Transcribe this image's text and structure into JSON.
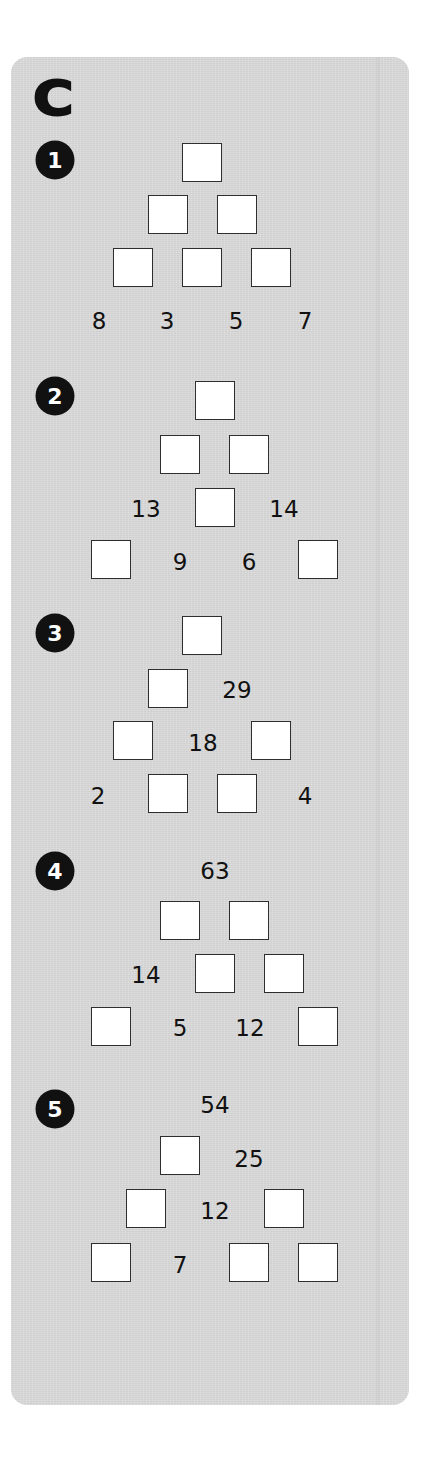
{
  "section": {
    "letter": "C",
    "background_color": "#d8d8d8",
    "box_fill": "#ffffff",
    "box_border": "#2e2e2e",
    "badge_color": "#111111"
  },
  "puzzles": [
    {
      "number": "1",
      "badge": {
        "cx": 55,
        "cy": 160
      },
      "boxes": [
        {
          "x": 182,
          "y": 143
        },
        {
          "x": 148,
          "y": 195
        },
        {
          "x": 217,
          "y": 195
        },
        {
          "x": 113,
          "y": 248
        },
        {
          "x": 182,
          "y": 248
        },
        {
          "x": 251,
          "y": 248
        }
      ],
      "numbers": [
        {
          "value": "8",
          "cx": 99,
          "cy": 321
        },
        {
          "value": "3",
          "cx": 167,
          "cy": 321
        },
        {
          "value": "5",
          "cx": 236,
          "cy": 321
        },
        {
          "value": "7",
          "cx": 305,
          "cy": 321
        }
      ]
    },
    {
      "number": "2",
      "badge": {
        "cx": 55,
        "cy": 396
      },
      "boxes": [
        {
          "x": 195,
          "y": 381
        },
        {
          "x": 160,
          "y": 435
        },
        {
          "x": 229,
          "y": 435
        },
        {
          "x": 195,
          "y": 488
        },
        {
          "x": 91,
          "y": 540
        },
        {
          "x": 298,
          "y": 540
        }
      ],
      "numbers": [
        {
          "value": "13",
          "cx": 146,
          "cy": 509
        },
        {
          "value": "14",
          "cx": 284,
          "cy": 509
        },
        {
          "value": "9",
          "cx": 180,
          "cy": 562
        },
        {
          "value": "6",
          "cx": 249,
          "cy": 562
        }
      ]
    },
    {
      "number": "3",
      "badge": {
        "cx": 55,
        "cy": 633
      },
      "boxes": [
        {
          "x": 182,
          "y": 616
        },
        {
          "x": 148,
          "y": 669
        },
        {
          "x": 113,
          "y": 721
        },
        {
          "x": 251,
          "y": 721
        },
        {
          "x": 148,
          "y": 774
        },
        {
          "x": 217,
          "y": 774
        }
      ],
      "numbers": [
        {
          "value": "29",
          "cx": 237,
          "cy": 690
        },
        {
          "value": "18",
          "cx": 203,
          "cy": 743
        },
        {
          "value": "2",
          "cx": 98,
          "cy": 796
        },
        {
          "value": "4",
          "cx": 305,
          "cy": 796
        }
      ]
    },
    {
      "number": "4",
      "badge": {
        "cx": 55,
        "cy": 871
      },
      "boxes": [
        {
          "x": 160,
          "y": 901
        },
        {
          "x": 229,
          "y": 901
        },
        {
          "x": 195,
          "y": 954
        },
        {
          "x": 264,
          "y": 954
        },
        {
          "x": 91,
          "y": 1007
        },
        {
          "x": 298,
          "y": 1007
        }
      ],
      "numbers": [
        {
          "value": "63",
          "cx": 215,
          "cy": 871
        },
        {
          "value": "14",
          "cx": 146,
          "cy": 975
        },
        {
          "value": "5",
          "cx": 180,
          "cy": 1028
        },
        {
          "value": "12",
          "cx": 250,
          "cy": 1028
        }
      ]
    },
    {
      "number": "5",
      "badge": {
        "cx": 55,
        "cy": 1109
      },
      "boxes": [
        {
          "x": 160,
          "y": 1136
        },
        {
          "x": 126,
          "y": 1189
        },
        {
          "x": 264,
          "y": 1189
        },
        {
          "x": 91,
          "y": 1243
        },
        {
          "x": 229,
          "y": 1243
        },
        {
          "x": 298,
          "y": 1243
        }
      ],
      "numbers": [
        {
          "value": "54",
          "cx": 215,
          "cy": 1105
        },
        {
          "value": "25",
          "cx": 249,
          "cy": 1159
        },
        {
          "value": "12",
          "cx": 215,
          "cy": 1211
        },
        {
          "value": "7",
          "cx": 180,
          "cy": 1265
        }
      ]
    }
  ]
}
